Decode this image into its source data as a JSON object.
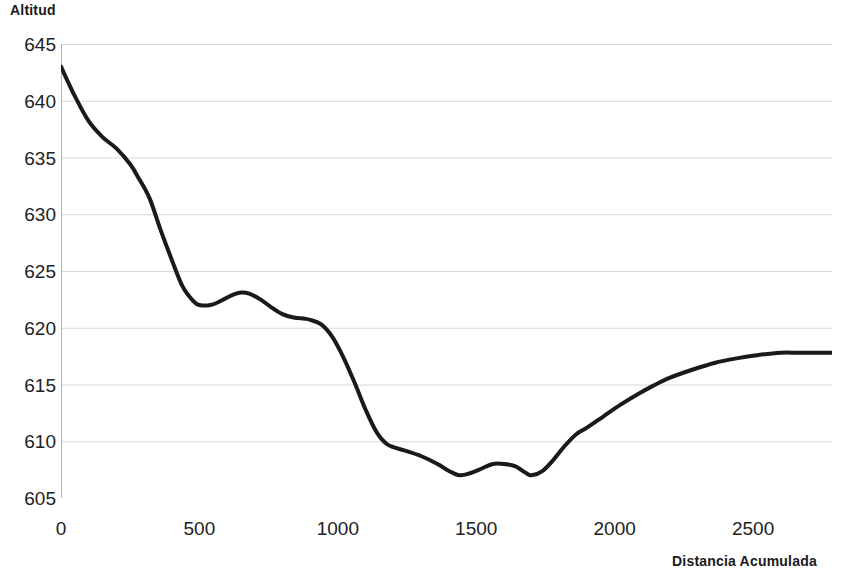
{
  "chart_data": {
    "type": "line",
    "title": "",
    "xlabel": "Distancia Acumulada",
    "ylabel": "Altitud",
    "xlim": [
      0,
      2785
    ],
    "ylim": [
      605,
      645
    ],
    "xticks": [
      0,
      500,
      1000,
      1500,
      2000,
      2500
    ],
    "xtick_labels": [
      "0",
      "500",
      "1000",
      "1500",
      "2000",
      "2500"
    ],
    "yticks": [
      605,
      610,
      615,
      620,
      625,
      630,
      635,
      640,
      645
    ],
    "ytick_labels": [
      "605",
      "610",
      "615",
      "620",
      "625",
      "630",
      "635",
      "640",
      "645"
    ],
    "grid": true,
    "grid_axis": "y",
    "legend": false,
    "line_color": "#1a1a1a",
    "line_width": 4,
    "series": [
      {
        "name": "Perfil de altitud",
        "x": [
          0,
          50,
          100,
          150,
          200,
          250,
          280,
          320,
          360,
          400,
          440,
          480,
          500,
          540,
          580,
          620,
          650,
          680,
          720,
          760,
          800,
          840,
          880,
          900,
          940,
          980,
          1020,
          1060,
          1100,
          1140,
          1180,
          1240,
          1300,
          1360,
          1400,
          1440,
          1480,
          1520,
          1560,
          1600,
          1640,
          1680,
          1700,
          1740,
          1780,
          1820,
          1860,
          1900,
          1960,
          2020,
          2080,
          2140,
          2200,
          2280,
          2360,
          2440,
          2520,
          2600,
          2660,
          2720,
          2785
        ],
        "y": [
          643.0,
          640.4,
          638.2,
          636.8,
          635.8,
          634.4,
          633.2,
          631.4,
          628.6,
          626.0,
          623.6,
          622.3,
          622.0,
          622.0,
          622.4,
          622.9,
          623.1,
          623.0,
          622.5,
          621.8,
          621.2,
          620.9,
          620.8,
          620.7,
          620.3,
          619.2,
          617.4,
          615.2,
          612.8,
          610.8,
          609.7,
          609.2,
          608.7,
          608.0,
          607.4,
          607.0,
          607.2,
          607.6,
          608.0,
          608.0,
          607.8,
          607.2,
          607.0,
          607.4,
          608.4,
          609.6,
          610.6,
          611.2,
          612.2,
          613.2,
          614.1,
          614.9,
          615.6,
          616.3,
          616.9,
          617.3,
          617.6,
          617.8,
          617.8,
          617.8,
          617.8
        ]
      }
    ],
    "axis": {
      "line_color": "#b4b4b4",
      "grid_color": "#d8d8d8"
    }
  }
}
